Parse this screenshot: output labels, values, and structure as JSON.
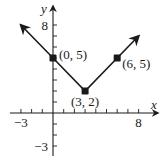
{
  "chart_data": {
    "type": "line",
    "title": "",
    "xlabel": "x",
    "ylabel": "y",
    "xlim": [
      -4.5,
      10
    ],
    "ylim": [
      -4,
      10
    ],
    "x_tick_labels": [
      {
        "value": -3,
        "label": "−3"
      },
      {
        "value": 8,
        "label": "8"
      }
    ],
    "y_tick_labels": [
      {
        "value": 8,
        "label": "8"
      },
      {
        "value": -3,
        "label": "−3"
      }
    ],
    "x_ticks": [
      -3,
      -2,
      -1,
      1,
      2,
      3,
      4,
      5,
      6,
      7,
      8
    ],
    "y_ticks": [
      -3,
      -2,
      -1,
      1,
      2,
      3,
      4,
      5,
      6,
      7,
      8
    ],
    "grid": false,
    "series": [
      {
        "name": "y = |x - 3| + 2",
        "x": [
          -3,
          0,
          3,
          6,
          8
        ],
        "y": [
          8,
          5,
          2,
          5,
          7
        ],
        "arrows": "both-ends",
        "color": "#1a1a1a"
      }
    ],
    "points": [
      {
        "x": 0,
        "y": 5,
        "label": "(0, 5)",
        "label_pos": "right"
      },
      {
        "x": 3,
        "y": 2,
        "label": "(3, 2)",
        "label_pos": "below"
      },
      {
        "x": 6,
        "y": 5,
        "label": "(6, 5)",
        "label_pos": "below-right"
      }
    ]
  }
}
